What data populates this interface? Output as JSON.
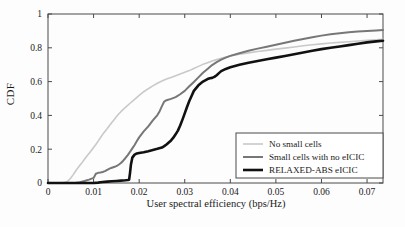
{
  "chart_data": {
    "type": "line",
    "title": "",
    "xlabel": "User spectral efficiency (bps/Hz)",
    "ylabel": "CDF",
    "xlim": [
      0,
      0.0735
    ],
    "ylim": [
      0,
      1
    ],
    "grid": false,
    "legend_position": "lower right",
    "xticks": [
      0,
      0.01,
      0.02,
      0.03,
      0.04,
      0.05,
      0.06,
      0.07
    ],
    "xticklabels": [
      "0",
      "0.01",
      "0.02",
      "0.03",
      "0.04",
      "0.05",
      "0.06",
      "0.07"
    ],
    "yticks": [
      0,
      0.2,
      0.4,
      0.6,
      0.8,
      1
    ],
    "yticklabels": [
      "0",
      "0.2",
      "0.4",
      "0.6",
      "0.8",
      "1"
    ],
    "series": [
      {
        "name": "No small cells",
        "color": "#c9c9c9",
        "width": 1.6,
        "x": [
          0.0,
          0.003,
          0.004,
          0.0045,
          0.005,
          0.0055,
          0.006,
          0.0065,
          0.007,
          0.0075,
          0.008,
          0.0085,
          0.009,
          0.0095,
          0.01,
          0.0105,
          0.011,
          0.0115,
          0.012,
          0.0125,
          0.013,
          0.0135,
          0.014,
          0.0145,
          0.015,
          0.0155,
          0.016,
          0.017,
          0.018,
          0.019,
          0.02,
          0.021,
          0.022,
          0.023,
          0.024,
          0.025,
          0.026,
          0.027,
          0.028,
          0.029,
          0.03,
          0.031,
          0.032,
          0.033,
          0.034,
          0.035,
          0.036,
          0.037,
          0.038,
          0.039,
          0.04,
          0.042,
          0.044,
          0.046,
          0.048,
          0.05,
          0.052,
          0.054,
          0.056,
          0.058,
          0.06,
          0.062,
          0.064,
          0.066,
          0.068,
          0.07,
          0.072,
          0.0735
        ],
        "y": [
          0.0,
          0.0,
          0.005,
          0.015,
          0.03,
          0.048,
          0.068,
          0.088,
          0.105,
          0.122,
          0.14,
          0.158,
          0.175,
          0.192,
          0.21,
          0.228,
          0.248,
          0.268,
          0.288,
          0.305,
          0.322,
          0.34,
          0.358,
          0.375,
          0.392,
          0.408,
          0.422,
          0.448,
          0.472,
          0.495,
          0.518,
          0.54,
          0.558,
          0.575,
          0.59,
          0.603,
          0.615,
          0.625,
          0.635,
          0.645,
          0.655,
          0.665,
          0.678,
          0.69,
          0.702,
          0.712,
          0.722,
          0.73,
          0.738,
          0.745,
          0.752,
          0.762,
          0.77,
          0.778,
          0.785,
          0.792,
          0.798,
          0.805,
          0.812,
          0.818,
          0.823,
          0.828,
          0.832,
          0.836,
          0.84,
          0.844,
          0.848,
          0.851
        ]
      },
      {
        "name": "Small cells with no eICIC",
        "color": "#777777",
        "width": 2.0,
        "x": [
          0.0,
          0.006,
          0.007,
          0.008,
          0.009,
          0.01,
          0.0105,
          0.011,
          0.0115,
          0.012,
          0.0125,
          0.013,
          0.0135,
          0.014,
          0.0145,
          0.015,
          0.0155,
          0.016,
          0.0165,
          0.017,
          0.0175,
          0.018,
          0.0185,
          0.019,
          0.0195,
          0.02,
          0.0205,
          0.021,
          0.0215,
          0.022,
          0.023,
          0.024,
          0.0245,
          0.025,
          0.0255,
          0.026,
          0.027,
          0.028,
          0.029,
          0.03,
          0.031,
          0.032,
          0.033,
          0.034,
          0.035,
          0.036,
          0.037,
          0.038,
          0.039,
          0.04,
          0.042,
          0.044,
          0.046,
          0.048,
          0.05,
          0.052,
          0.054,
          0.056,
          0.058,
          0.06,
          0.062,
          0.064,
          0.066,
          0.068,
          0.07,
          0.072,
          0.0735
        ],
        "y": [
          0.0,
          0.0,
          0.005,
          0.012,
          0.02,
          0.03,
          0.055,
          0.06,
          0.062,
          0.065,
          0.07,
          0.078,
          0.085,
          0.09,
          0.095,
          0.1,
          0.108,
          0.118,
          0.132,
          0.148,
          0.165,
          0.185,
          0.205,
          0.225,
          0.248,
          0.27,
          0.288,
          0.305,
          0.32,
          0.335,
          0.37,
          0.402,
          0.425,
          0.455,
          0.482,
          0.49,
          0.498,
          0.508,
          0.525,
          0.545,
          0.572,
          0.598,
          0.625,
          0.652,
          0.675,
          0.698,
          0.715,
          0.73,
          0.742,
          0.752,
          0.768,
          0.782,
          0.795,
          0.806,
          0.818,
          0.83,
          0.842,
          0.852,
          0.862,
          0.872,
          0.88,
          0.886,
          0.892,
          0.896,
          0.9,
          0.903,
          0.905
        ]
      },
      {
        "name": "RELAXED-ABS eICIC",
        "color": "#111111",
        "width": 2.6,
        "x": [
          0.0,
          0.01,
          0.011,
          0.0115,
          0.012,
          0.013,
          0.014,
          0.015,
          0.016,
          0.017,
          0.0175,
          0.0178,
          0.018,
          0.0182,
          0.0185,
          0.019,
          0.0195,
          0.02,
          0.021,
          0.022,
          0.023,
          0.024,
          0.025,
          0.0255,
          0.026,
          0.0265,
          0.027,
          0.0275,
          0.028,
          0.0285,
          0.029,
          0.0295,
          0.03,
          0.0305,
          0.031,
          0.0315,
          0.032,
          0.033,
          0.034,
          0.035,
          0.0355,
          0.036,
          0.0365,
          0.037,
          0.0375,
          0.038,
          0.039,
          0.04,
          0.042,
          0.044,
          0.046,
          0.048,
          0.05,
          0.052,
          0.054,
          0.056,
          0.058,
          0.06,
          0.062,
          0.064,
          0.066,
          0.068,
          0.07,
          0.072,
          0.0735
        ],
        "y": [
          0.0,
          0.0,
          0.002,
          0.004,
          0.006,
          0.008,
          0.01,
          0.012,
          0.014,
          0.016,
          0.018,
          0.02,
          0.06,
          0.11,
          0.15,
          0.168,
          0.175,
          0.178,
          0.182,
          0.188,
          0.195,
          0.202,
          0.21,
          0.218,
          0.228,
          0.24,
          0.252,
          0.268,
          0.288,
          0.31,
          0.34,
          0.375,
          0.412,
          0.45,
          0.485,
          0.515,
          0.545,
          0.578,
          0.6,
          0.615,
          0.62,
          0.622,
          0.628,
          0.638,
          0.65,
          0.662,
          0.675,
          0.685,
          0.7,
          0.712,
          0.722,
          0.732,
          0.742,
          0.752,
          0.762,
          0.772,
          0.782,
          0.792,
          0.8,
          0.808,
          0.816,
          0.824,
          0.832,
          0.838,
          0.842
        ]
      }
    ]
  },
  "legend": {
    "items": [
      {
        "label": "No small cells"
      },
      {
        "label": "Small cells with no eICIC"
      },
      {
        "label": "RELAXED-ABS eICIC"
      }
    ]
  }
}
